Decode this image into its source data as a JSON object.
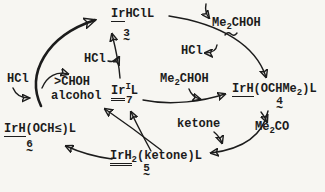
{
  "colors": {
    "ink": "#1c1c1c",
    "background": "#f7f6f2"
  },
  "tilde": "~",
  "compounds": {
    "irhcll": {
      "prefix": "Ir",
      "rest": "HClL",
      "number": "3"
    },
    "irl": {
      "prefix": "Ir",
      "oxidation": "I",
      "rest": "L",
      "number": "7"
    },
    "irh_ochme2": {
      "prefix": "IrH",
      "part1": "(OCHMe",
      "sub": "2",
      "part2": ")L",
      "number": "4"
    },
    "irh2_ketone": {
      "prefix": "IrH",
      "sub": "2",
      "rest": "(ketone)L",
      "number": "5"
    },
    "irh_och": {
      "prefix": "IrH",
      "rest": "(OCH≤)L",
      "number": "6"
    }
  },
  "species": {
    "hcl_left": "HCl",
    "hcl_center": "HCl",
    "hcl_right": "HCl",
    "isopropanol_top": {
      "pre": "Me",
      "sub": "2",
      "post": "CHOH"
    },
    "isopropanol_center": {
      "pre": "Me",
      "sub": "2",
      "post": "CHOH"
    },
    "acetone": {
      "pre": "Me",
      "sub": "2",
      "post": "CO"
    },
    "sec_alcohol": ">CHOH",
    "alcohol_word": "alcohol",
    "ketone_word": "ketone"
  }
}
